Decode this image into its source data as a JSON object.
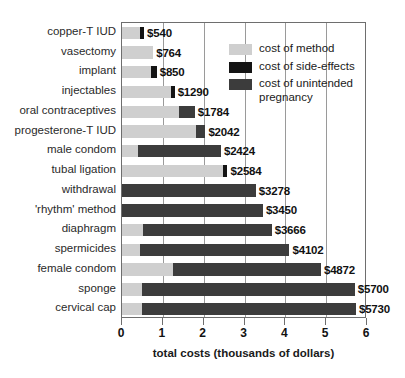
{
  "chart_data": {
    "type": "bar",
    "orientation": "horizontal",
    "stacked": true,
    "title": "",
    "xlabel": "total costs (thousands of dollars)",
    "ylabel": "",
    "xlim": [
      0,
      6
    ],
    "xticks": [
      "0",
      "1",
      "2",
      "3",
      "4",
      "5",
      "6"
    ],
    "grid": "vertical",
    "legend_position": "top-right",
    "categories": [
      "copper-T IUD",
      "vasectomy",
      "implant",
      "injectables",
      "oral contraceptives",
      "progesterone-T IUD",
      "male condom",
      "tubal ligation",
      "withdrawal",
      "'rhythm' method",
      "diaphragm",
      "spermicides",
      "female condom",
      "sponge",
      "cervical cap"
    ],
    "series": [
      {
        "name": "cost of method",
        "color": "#cfcfcf",
        "values": [
          0.45,
          0.764,
          0.72,
          1.2,
          1.4,
          1.8,
          0.4,
          2.47,
          0,
          0,
          0.52,
          0.45,
          1.25,
          0.5,
          0.5
        ]
      },
      {
        "name": "cost of side-effects",
        "color": "#141414",
        "values": [
          0.09,
          0,
          0.13,
          0.09,
          0,
          0,
          0,
          0.114,
          0,
          0,
          0,
          0,
          0,
          0,
          0
        ]
      },
      {
        "name": "cost of unintended pregnancy",
        "color": "#3c3c3c",
        "values": [
          0,
          0,
          0,
          0,
          0.384,
          0.242,
          2.024,
          0,
          3.278,
          3.45,
          3.146,
          3.652,
          3.622,
          5.2,
          5.23
        ]
      }
    ],
    "totals": [
      540,
      764,
      850,
      1290,
      1784,
      2042,
      2424,
      2584,
      3278,
      3450,
      3666,
      4102,
      4872,
      5700,
      5730
    ],
    "value_labels": [
      "$540",
      "$764",
      "$850",
      "$1290",
      "$1784",
      "$2042",
      "$2424",
      "$2584",
      "$3278",
      "$3450",
      "$3666",
      "$4102",
      "$4872",
      "$5700",
      "$5730"
    ]
  },
  "legend": {
    "items": [
      {
        "label": "cost of method",
        "color": "#cfcfcf",
        "swatch_name": "legend-swatch-method"
      },
      {
        "label": "cost of side-effects",
        "color": "#141414",
        "swatch_name": "legend-swatch-side-effects"
      },
      {
        "label": "cost of unintended pregnancy",
        "color": "#3c3c3c",
        "swatch_name": "legend-swatch-unintended-pregnancy"
      }
    ]
  },
  "axis": {
    "x_title": "total costs (thousands of dollars)",
    "x_tick_labels": [
      "0",
      "1",
      "2",
      "3",
      "4",
      "5",
      "6"
    ]
  }
}
